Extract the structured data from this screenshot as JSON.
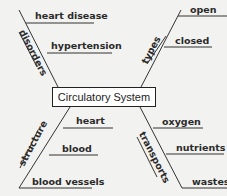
{
  "center": {
    "title": "Circulatory System"
  },
  "branches": {
    "disorders": {
      "label": "disorders",
      "items": [
        "heart disease",
        "hypertension"
      ]
    },
    "types": {
      "label": "types",
      "items": [
        "open",
        "closed"
      ]
    },
    "structure": {
      "label": "structure",
      "items": [
        "heart",
        "blood",
        "blood vessels"
      ]
    },
    "transports": {
      "label": "transports",
      "items": [
        "oxygen",
        "nutrients",
        "wastes"
      ]
    }
  },
  "colors": {
    "line": "#333333",
    "background": "#f2f2f0",
    "box": "#ffffff"
  }
}
